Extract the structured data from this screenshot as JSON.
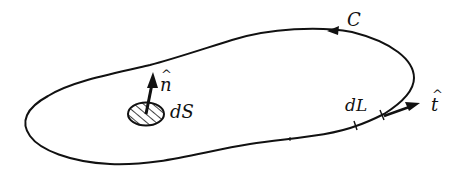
{
  "diagram": {
    "labels": {
      "curve": "C",
      "normal_hat": "^",
      "normal": "n",
      "surface_element": "dS",
      "line_element": "dL",
      "tangent_hat": "^",
      "tangent": "t"
    },
    "colors": {
      "stroke": "#111111",
      "background": "#ffffff"
    }
  }
}
